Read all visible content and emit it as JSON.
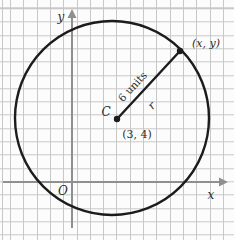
{
  "figure": {
    "type": "circle-on-coordinate-grid",
    "axes": {
      "x_label": "x",
      "y_label": "y",
      "origin_label": "O"
    },
    "circle": {
      "center_label": "C",
      "center_point": "(3, 4)",
      "radius_length_label": "6 units",
      "radius_symbol": "r",
      "boundary_point_label": "(x, y)"
    },
    "colors": {
      "background": "#fcfcfc",
      "grid": "#c8c8c8",
      "axis": "#8f8f8f",
      "shape": "#1c1c1c",
      "text": "#2b2b2b"
    }
  }
}
